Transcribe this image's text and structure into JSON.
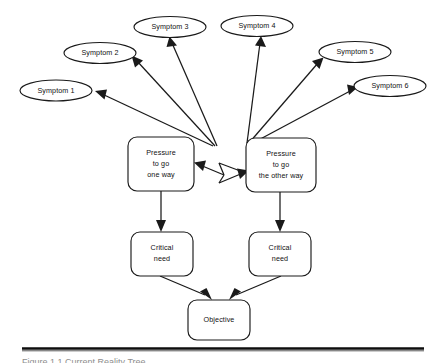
{
  "diagram": {
    "type": "conflict-resolution-diagram",
    "symptoms": [
      {
        "id": "symptom-1",
        "label": "Symptom 1",
        "cx": 56,
        "cy": 90.5,
        "rx": 36,
        "ry": 10.5
      },
      {
        "id": "symptom-2",
        "label": "Symptom 2",
        "cx": 100,
        "cy": 53,
        "rx": 36,
        "ry": 10.5
      },
      {
        "id": "symptom-3",
        "label": "Symptom 3",
        "cx": 170,
        "cy": 27,
        "rx": 36,
        "ry": 10.5
      },
      {
        "id": "symptom-4",
        "label": "Symptom 4",
        "cx": 257,
        "cy": 26,
        "rx": 36,
        "ry": 10.5
      },
      {
        "id": "symptom-5",
        "label": "Symptom 5",
        "cx": 355,
        "cy": 52,
        "rx": 36,
        "ry": 10.5
      },
      {
        "id": "symptom-6",
        "label": "Symptom 6",
        "cx": 390,
        "cy": 86,
        "rx": 36,
        "ry": 10.5
      }
    ],
    "pressures": [
      {
        "id": "pressure-left",
        "lines": [
          "Pressure",
          "to go",
          "one way"
        ],
        "x": 128,
        "y": 137,
        "w": 66,
        "h": 54
      },
      {
        "id": "pressure-right",
        "lines": [
          "Pressure",
          "to go",
          "the other way"
        ],
        "x": 246,
        "y": 138,
        "w": 70,
        "h": 54
      }
    ],
    "critical_needs": [
      {
        "id": "critical-need-left",
        "lines": [
          "Critical",
          "need"
        ],
        "x": 131,
        "y": 232,
        "w": 62,
        "h": 44
      },
      {
        "id": "critical-need-right",
        "lines": [
          "Critical",
          "need"
        ],
        "x": 249,
        "y": 232,
        "w": 62,
        "h": 44
      }
    ],
    "objective": {
      "id": "objective",
      "lines": [
        "Objective"
      ],
      "x": 188,
      "y": 300,
      "w": 62,
      "h": 40
    },
    "conflict_arrow": {
      "id": "conflict-zigzag",
      "description": "double-headed zigzag arrow between the two pressure boxes"
    },
    "colors": {
      "stroke": "#1a1a1a",
      "fill": "#ffffff",
      "text": "#111111",
      "rule": "#0d0d0d"
    }
  },
  "footer": {
    "rule_label": "horizontal-rule",
    "caption": "Figure 1.1  Current Reality Tree"
  }
}
